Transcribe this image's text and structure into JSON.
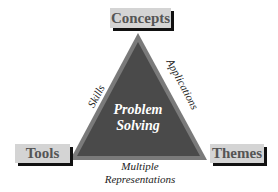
{
  "diagram": {
    "center": {
      "line1": "Problem",
      "line2": "Solving"
    },
    "vertices": {
      "top": "Concepts",
      "left": "Tools",
      "right": "Themes"
    },
    "edges": {
      "left": "Skills",
      "right": "Applications",
      "bottom_line1": "Multiple",
      "bottom_line2": "Representations"
    },
    "colors": {
      "triangle_fill": "#4a4a4a",
      "triangle_border": "#7a7a7a",
      "box_fill": "#d4d4d4",
      "box_shadow": "#111111"
    }
  }
}
